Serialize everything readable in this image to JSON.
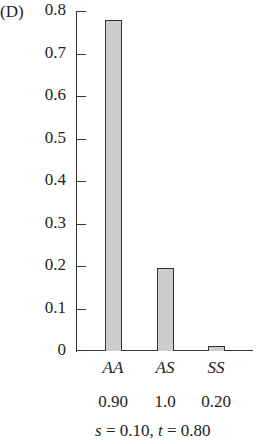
{
  "panel_label": "(D)",
  "caption": {
    "s_var": "s",
    "s_eq": " = 0.10, ",
    "t_var": "t",
    "t_eq": " = 0.80"
  },
  "chart_data": {
    "type": "bar",
    "title": "",
    "panel": "(D)",
    "xlabel": "",
    "ylabel": "",
    "ylim": [
      0,
      0.8
    ],
    "yticks": [
      "0",
      "0.1",
      "0.2",
      "0.3",
      "0.4",
      "0.5",
      "0.6",
      "0.7",
      "0.8"
    ],
    "grid": false,
    "legend": null,
    "categories": [
      "AA",
      "AS",
      "SS"
    ],
    "category_fitness_labels": [
      "0.90",
      "1.0",
      "0.20"
    ],
    "values": [
      0.78,
      0.195,
      0.012
    ],
    "bar_color": "#cccccc",
    "annotation": "s = 0.10, t = 0.80"
  }
}
